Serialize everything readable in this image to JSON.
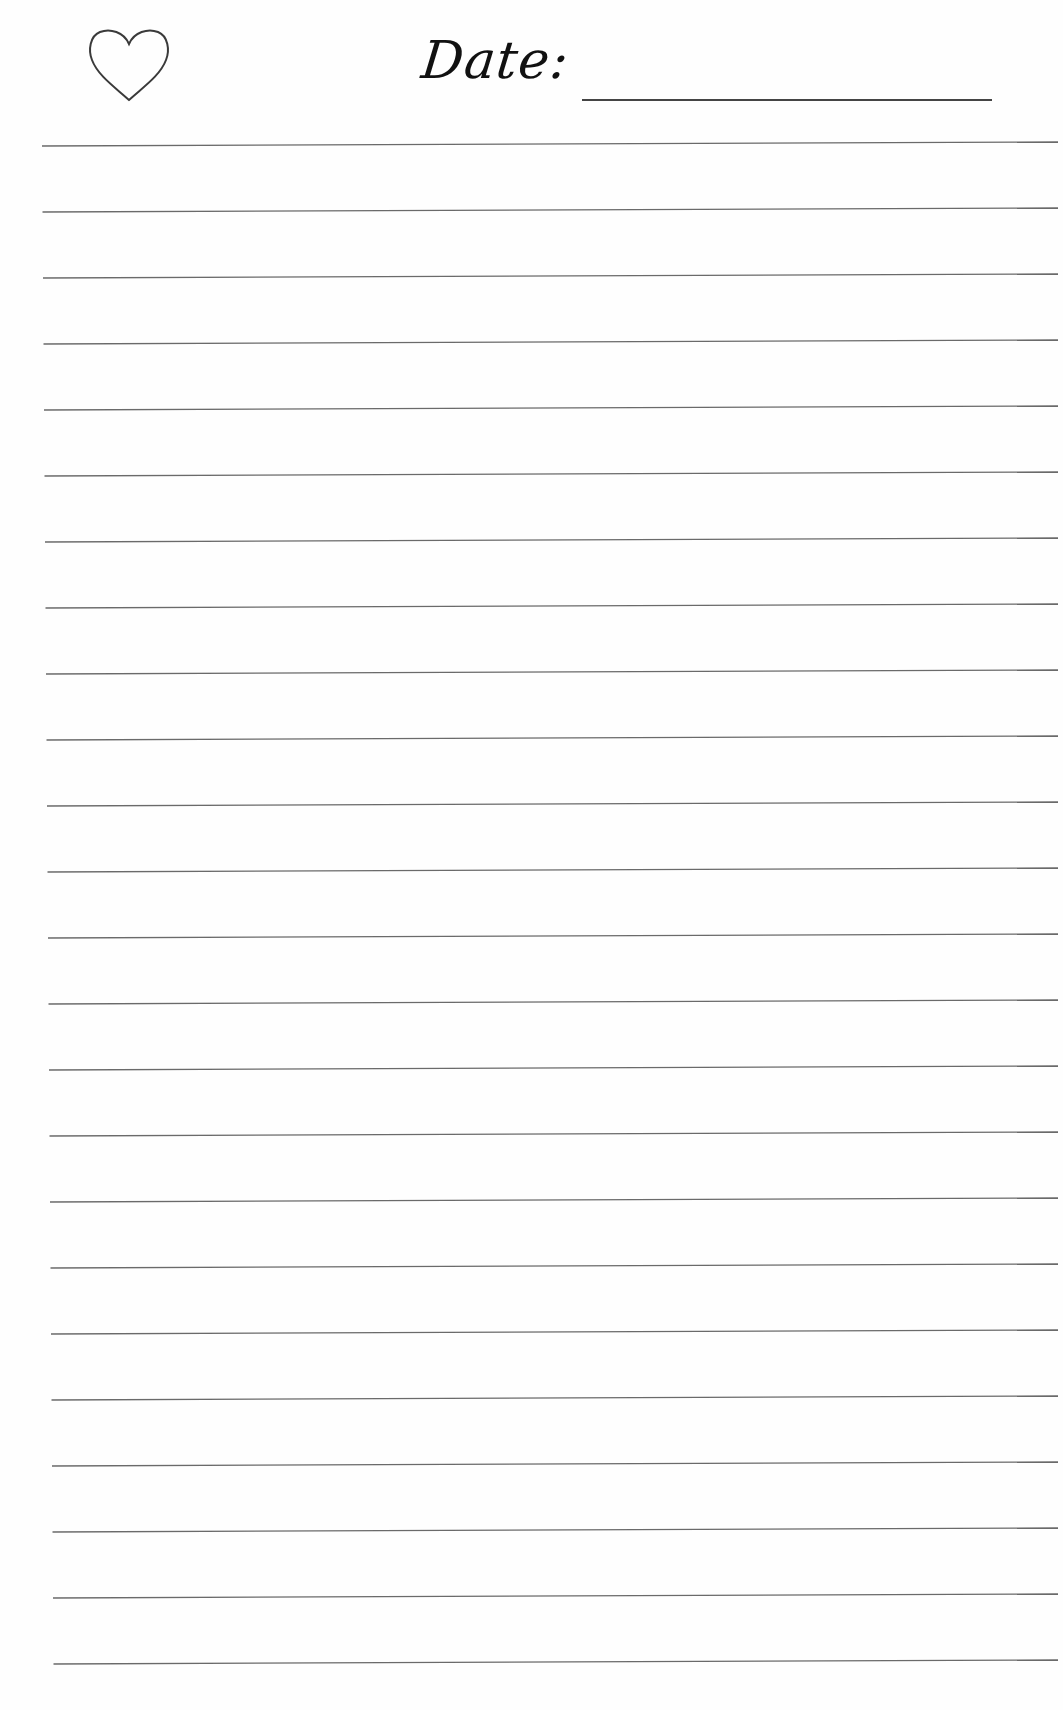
{
  "page": {
    "type": "lined journal page",
    "background": "#fefefe",
    "line_color": "#6a6a6a"
  },
  "header": {
    "icon": "heart-outline-icon",
    "date_label": "Date:",
    "date_value": ""
  },
  "rules": {
    "count": 24,
    "first_y": 144,
    "spacing": 66,
    "left_x": 42,
    "right_x": 1058
  }
}
